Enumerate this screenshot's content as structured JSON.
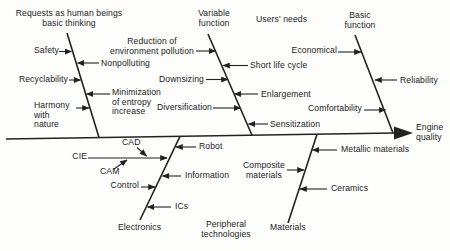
{
  "colors": {
    "ink": "#222222",
    "background": "#fdfdfc"
  },
  "effect": {
    "label": "Engine\nquality"
  },
  "groups": {
    "requests": {
      "heading": "Requests as human beings\nbasic thinking",
      "safety": "Safety",
      "nonpolluting": "Nonpolluting",
      "recyclability": "Recyclability",
      "entropy": "Minimization\nof entropy\nincrease",
      "harmony": "Harmony\nwith\nnature"
    },
    "variable_function": {
      "heading": "Variable\nfunction",
      "reduction": "Reduction of\nenvironment pollution",
      "short_life_cycle": "Short life cycle",
      "downsizing": "Downsizing",
      "enlargement": "Enlargement",
      "diversification": "Diversification",
      "sensitization": "Sensitization"
    },
    "users_needs": {
      "heading": "Users' needs"
    },
    "basic_function": {
      "heading": "Basic\nfunction",
      "economical": "Economical",
      "reliability": "Reliability",
      "comfortability": "Comfortability"
    },
    "electronics": {
      "heading": "Electronics",
      "cad": "CAD",
      "cie": "CIE",
      "cam": "CAM",
      "control": "Control",
      "robot": "Robot",
      "information": "Information",
      "ics": "ICs"
    },
    "peripheral_technologies": {
      "heading": "Peripheral\ntechnologies"
    },
    "materials": {
      "heading": "Materials",
      "composite": "Composite\nmaterials",
      "metallic": "Metallic materials",
      "ceramics": "Ceramics"
    }
  }
}
